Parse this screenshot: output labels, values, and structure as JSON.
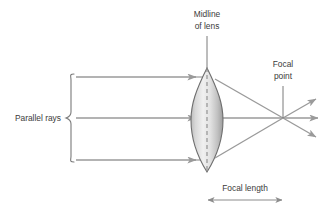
{
  "diagram": {
    "labels": {
      "midline_line1": "Midline",
      "midline_line2": "of lens",
      "focal_point_line1": "Focal",
      "focal_point_line2": "point",
      "parallel_rays": "Parallel rays",
      "focal_length": "Focal length"
    },
    "colors": {
      "ray": "#9a9a9a",
      "outline": "#6e6e6e",
      "text": "#3b3b3b",
      "leader": "#7a7a7a",
      "lens_light": "#f2f2f2",
      "lens_dark": "#a8a8a8",
      "background": "#ffffff"
    },
    "geometry": {
      "lens_center_x": 207,
      "lens_top_y": 68,
      "lens_bottom_y": 172,
      "lens_half_width": 16,
      "focal_point_x": 283,
      "axis_y": 118,
      "ray_top_y": 77,
      "ray_bottom_y": 160,
      "ray_start_x": 72,
      "brace_x": 70,
      "focal_length_y": 200
    },
    "elements": {
      "lens": "biconvex-lens",
      "midline": "dashed-vertical-midline",
      "rays_in": 3,
      "rays_out": 3,
      "focal_length_dimension": "double-headed-arrow"
    }
  }
}
